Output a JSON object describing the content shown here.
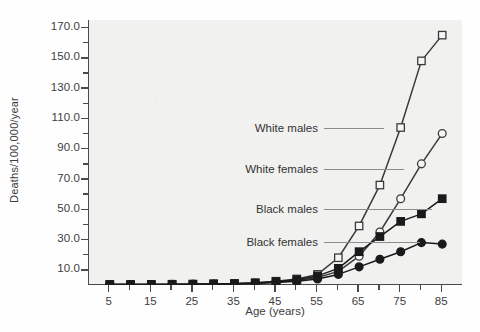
{
  "chart_data": {
    "type": "line",
    "title": "",
    "xlabel": "Age (years)",
    "ylabel": "Deaths/100,000/year",
    "xlim": [
      0,
      90
    ],
    "ylim": [
      0,
      175
    ],
    "grid": false,
    "legend_position": "inline-annotations",
    "x": [
      5,
      15,
      25,
      35,
      45,
      55,
      65,
      75,
      85
    ],
    "x_ticks_major": [
      "5",
      "15",
      "25",
      "35",
      "45",
      "55",
      "65",
      "75",
      "85"
    ],
    "x_tick_values": [
      5,
      15,
      25,
      35,
      45,
      55,
      65,
      75,
      85
    ],
    "x_minor_tick_values": [
      10,
      20,
      30,
      40,
      50,
      60,
      70,
      80
    ],
    "y_ticks_major": [
      "10.0",
      "30.0",
      "50.0",
      "70.0",
      "90.0",
      "110.0",
      "130.0",
      "150.0",
      "170.0"
    ],
    "y_tick_values": [
      10,
      30,
      50,
      70,
      90,
      110,
      130,
      150,
      170
    ],
    "y_minor_tick_values": [
      20,
      40,
      60,
      80,
      100,
      120,
      140,
      160
    ],
    "series": [
      {
        "name": "White males",
        "marker": "open-square",
        "color": "#3a3a3a",
        "x": [
          5,
          10,
          15,
          20,
          25,
          30,
          35,
          40,
          45,
          50,
          55,
          60,
          65,
          70,
          75,
          80,
          85
        ],
        "values": [
          0.3,
          0.3,
          0.4,
          0.5,
          0.6,
          0.8,
          1.0,
          1.5,
          2.5,
          4.0,
          7.0,
          18.0,
          39.0,
          66.0,
          104.0,
          148.0,
          165.0
        ]
      },
      {
        "name": "White females",
        "marker": "open-circle",
        "color": "#3a3a3a",
        "x": [
          5,
          10,
          15,
          20,
          25,
          30,
          35,
          40,
          45,
          50,
          55,
          60,
          65,
          70,
          75,
          80,
          85
        ],
        "values": [
          0.3,
          0.3,
          0.3,
          0.4,
          0.5,
          0.6,
          0.8,
          1.2,
          2.0,
          3.0,
          5.0,
          9.0,
          19.0,
          35.0,
          57.0,
          80.0,
          100.0
        ]
      },
      {
        "name": "Black males",
        "marker": "filled-square",
        "color": "#1a1a1a",
        "x": [
          5,
          10,
          15,
          20,
          25,
          30,
          35,
          40,
          45,
          50,
          55,
          60,
          65,
          70,
          75,
          80,
          85
        ],
        "values": [
          0.3,
          0.3,
          0.3,
          0.4,
          0.5,
          0.7,
          0.9,
          1.3,
          2.2,
          3.5,
          6.0,
          11.0,
          22.0,
          32.0,
          42.0,
          47.0,
          57.0
        ]
      },
      {
        "name": "Black females",
        "marker": "filled-circle",
        "color": "#1a1a1a",
        "x": [
          5,
          10,
          15,
          20,
          25,
          30,
          35,
          40,
          45,
          50,
          55,
          60,
          65,
          70,
          75,
          80,
          85
        ],
        "values": [
          0.3,
          0.3,
          0.3,
          0.3,
          0.4,
          0.5,
          0.7,
          1.0,
          1.6,
          2.5,
          4.0,
          7.0,
          12.0,
          17.0,
          22.0,
          28.0,
          27.0
        ]
      }
    ],
    "annotations": [
      {
        "text": "White males",
        "series": "White males"
      },
      {
        "text": "White females",
        "series": "White females"
      },
      {
        "text": "Black males",
        "series": "Black males"
      },
      {
        "text": "Black females",
        "series": "Black females"
      }
    ]
  },
  "colors": {
    "plot_background": "#f1f1f0",
    "page_background": "#fefefe",
    "axis": "#4a4a4a",
    "text": "#3d3d3d",
    "line_white_series": "#3a3a3a",
    "line_black_series": "#1a1a1a",
    "leader_line": "#8d8d8d"
  }
}
